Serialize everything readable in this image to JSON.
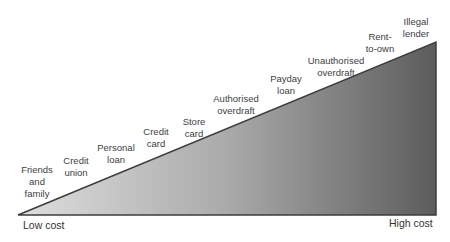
{
  "diagram": {
    "type": "cost-spectrum-triangle",
    "gradient": {
      "start_color": "#dcdcdc",
      "end_color": "#5a5a5a",
      "edge_color": "#3c3c3c"
    },
    "axis": {
      "low_label": "Low cost",
      "high_label": "High cost"
    },
    "items": [
      {
        "label": "Friends\nand\nfamily"
      },
      {
        "label": "Credit\nunion"
      },
      {
        "label": "Personal\nloan"
      },
      {
        "label": "Credit\ncard"
      },
      {
        "label": "Store\ncard"
      },
      {
        "label": "Authorised\noverdraft"
      },
      {
        "label": "Payday\nloan"
      },
      {
        "label": "Unauthorised\noverdraft"
      },
      {
        "label": "Rent-\nto-own"
      },
      {
        "label": "Illegal\nlender"
      }
    ]
  }
}
